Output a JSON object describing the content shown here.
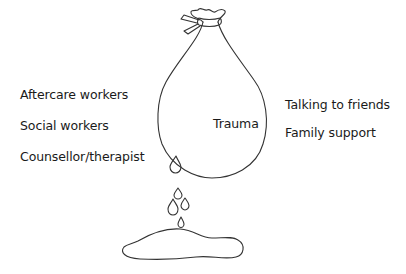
{
  "diagram": {
    "center_label": "Trauma",
    "left_labels": [
      "Aftercare workers",
      "Social workers",
      "Counsellor/therapist"
    ],
    "right_labels": [
      "Talking to friends",
      "Family support"
    ],
    "icons": [
      "tied-sack-icon",
      "water-drop-icon",
      "puddle-icon"
    ],
    "colors": {
      "stroke": "#333333",
      "text": "#1a1a1a",
      "background": "#ffffff"
    }
  }
}
